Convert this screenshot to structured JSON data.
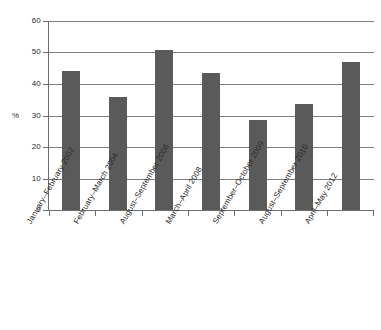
{
  "chart_data": {
    "type": "bar",
    "title": "",
    "xlabel": "",
    "ylabel": "%",
    "categories": [
      "January–February 2002",
      "February–March 2004",
      "August–September 2006",
      "March–April 2008",
      "September–October 2009",
      "August–September 2010",
      "April–May 2012"
    ],
    "values": [
      44.1,
      35.9,
      50.8,
      43.4,
      28.6,
      33.5,
      46.9
    ],
    "ylim": [
      0,
      60
    ],
    "yticks": [
      0,
      10,
      20,
      30,
      40,
      50,
      60
    ],
    "ytick_labels": [
      "0",
      "10",
      "20",
      "30",
      "40",
      "50",
      "60"
    ],
    "grid": true,
    "legend": "none",
    "bar_color": "#5a5a5a",
    "axis_color": "#6e6e6e",
    "grid_color": "#7d7d7d",
    "background": "#ffffff"
  }
}
